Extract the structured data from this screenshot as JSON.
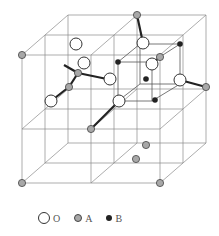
{
  "figure": {
    "type": "crystal-structure-unit-cell"
  },
  "colors": {
    "edge": "#8a8a8a",
    "bond": "#222222",
    "atom_O_fill": "#ffffff",
    "atom_O_stroke": "#333333",
    "atom_A_fill": "#a8a8a8",
    "atom_A_stroke": "#444444",
    "atom_B_fill": "#222222"
  },
  "legend": {
    "items": [
      {
        "symbol": "O",
        "label": "O"
      },
      {
        "symbol": "A",
        "label": "A"
      },
      {
        "symbol": "B",
        "label": "B"
      }
    ]
  },
  "geometry": {
    "edges": [
      [
        22,
        55,
        160,
        55
      ],
      [
        22,
        129,
        160,
        129
      ],
      [
        22,
        183,
        160,
        183
      ],
      [
        22,
        55,
        22,
        183
      ],
      [
        91,
        55,
        91,
        183
      ],
      [
        160,
        55,
        160,
        183
      ],
      [
        45,
        35,
        183,
        35
      ],
      [
        45,
        109,
        183,
        109
      ],
      [
        45,
        163,
        183,
        163
      ],
      [
        45,
        35,
        45,
        163
      ],
      [
        114,
        35,
        114,
        163
      ],
      [
        183,
        35,
        183,
        163
      ],
      [
        68,
        15,
        206,
        15
      ],
      [
        68,
        89,
        206,
        89
      ],
      [
        68,
        143,
        206,
        143
      ],
      [
        68,
        15,
        68,
        143
      ],
      [
        137,
        15,
        137,
        143
      ],
      [
        206,
        15,
        206,
        143
      ],
      [
        22,
        55,
        68,
        15
      ],
      [
        91,
        55,
        137,
        15
      ],
      [
        160,
        55,
        206,
        15
      ],
      [
        22,
        129,
        68,
        89
      ],
      [
        91,
        129,
        137,
        89
      ],
      [
        160,
        129,
        206,
        89
      ],
      [
        22,
        183,
        68,
        143
      ],
      [
        91,
        183,
        137,
        143
      ],
      [
        160,
        183,
        206,
        143
      ]
    ],
    "subcube_edges": [
      [
        118,
        62,
        152,
        62
      ],
      [
        118,
        101,
        152,
        101
      ],
      [
        118,
        62,
        118,
        101
      ],
      [
        152,
        62,
        152,
        101
      ],
      [
        140,
        44,
        180,
        44
      ],
      [
        140,
        84,
        180,
        84
      ],
      [
        140,
        44,
        140,
        84
      ],
      [
        180,
        44,
        180,
        84
      ],
      [
        118,
        62,
        140,
        44
      ],
      [
        152,
        62,
        180,
        44
      ],
      [
        118,
        101,
        140,
        84
      ],
      [
        152,
        101,
        180,
        84
      ]
    ],
    "bonds": [
      [
        137,
        15,
        143,
        43
      ],
      [
        160,
        57,
        152,
        64
      ],
      [
        206,
        87,
        180,
        80
      ],
      [
        78,
        73,
        64,
        65
      ],
      [
        78,
        73,
        107,
        79
      ],
      [
        78,
        73,
        69,
        87
      ],
      [
        69,
        87,
        51,
        101
      ],
      [
        91,
        129,
        119,
        101
      ]
    ],
    "atoms_O": [
      [
        76,
        44,
        6
      ],
      [
        84,
        63,
        6
      ],
      [
        110,
        79,
        6
      ],
      [
        51,
        101,
        6
      ],
      [
        143,
        43,
        6
      ],
      [
        152,
        64,
        6
      ],
      [
        180,
        80,
        6
      ],
      [
        119,
        101,
        6
      ],
      [
        137,
        15,
        0
      ]
    ],
    "atoms_A": [
      [
        22,
        55
      ],
      [
        160,
        57
      ],
      [
        206,
        87
      ],
      [
        137,
        15
      ],
      [
        78,
        73
      ],
      [
        69,
        87
      ],
      [
        91,
        129
      ],
      [
        136,
        159
      ],
      [
        146,
        145
      ],
      [
        22,
        183
      ],
      [
        160,
        183
      ]
    ],
    "atoms_B": [
      [
        118,
        62
      ],
      [
        180,
        44
      ],
      [
        146,
        79
      ],
      [
        155,
        100
      ]
    ]
  }
}
